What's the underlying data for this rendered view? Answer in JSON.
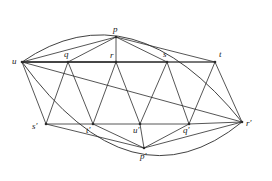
{
  "figure": {
    "type": "planar-graph-diagram",
    "width": 272,
    "height": 181,
    "background_color": "#ffffff",
    "stroke_color": "#2b2b2b",
    "label_color": "#1a1a1a",
    "stroke_width": 0.8,
    "boundary_stroke_width": 0.9
  },
  "vertices": [
    {
      "id": "u",
      "label": "u",
      "x": 22,
      "y": 62,
      "label_x": 12,
      "label_y": 57,
      "dot": true
    },
    {
      "id": "p",
      "label": "p",
      "x": 116,
      "y": 37,
      "label_x": 113,
      "label_y": 25,
      "dot": true
    },
    {
      "id": "q",
      "label": "q",
      "x": 68,
      "y": 62,
      "label_x": 64,
      "label_y": 50,
      "dot": true
    },
    {
      "id": "r",
      "label": "r",
      "x": 116,
      "y": 62,
      "label_x": 110,
      "label_y": 51,
      "dot": true
    },
    {
      "id": "s",
      "label": "s",
      "x": 167,
      "y": 62,
      "label_x": 163,
      "label_y": 50,
      "dot": true
    },
    {
      "id": "t",
      "label": "t",
      "x": 215,
      "y": 62,
      "label_x": 219,
      "label_y": 50,
      "dot": true
    },
    {
      "id": "sp",
      "label": "s′",
      "x": 46,
      "y": 124,
      "label_x": 32,
      "label_y": 122,
      "dot": true
    },
    {
      "id": "tp",
      "label": "t′",
      "x": 93,
      "y": 124,
      "label_x": 86,
      "label_y": 126,
      "dot": true
    },
    {
      "id": "up",
      "label": "u′",
      "x": 140,
      "y": 124,
      "label_x": 133,
      "label_y": 126,
      "dot": true
    },
    {
      "id": "qp",
      "label": "q′",
      "x": 189,
      "y": 124,
      "label_x": 183,
      "label_y": 126,
      "dot": true
    },
    {
      "id": "rp",
      "label": "r′",
      "x": 242,
      "y": 122,
      "label_x": 246,
      "label_y": 119,
      "dot": true
    },
    {
      "id": "pp",
      "label": "p′",
      "x": 144,
      "y": 148,
      "label_x": 140,
      "label_y": 152,
      "dot": true
    }
  ],
  "edges": [
    {
      "from": "u",
      "to": "p"
    },
    {
      "from": "u",
      "to": "q"
    },
    {
      "from": "u",
      "to": "r"
    },
    {
      "from": "u",
      "to": "s"
    },
    {
      "from": "u",
      "to": "t"
    },
    {
      "from": "p",
      "to": "q"
    },
    {
      "from": "p",
      "to": "r"
    },
    {
      "from": "p",
      "to": "s"
    },
    {
      "from": "p",
      "to": "t"
    },
    {
      "from": "q",
      "to": "r"
    },
    {
      "from": "r",
      "to": "s"
    },
    {
      "from": "s",
      "to": "t"
    },
    {
      "from": "u",
      "to": "sp"
    },
    {
      "from": "u",
      "to": "rp"
    },
    {
      "from": "q",
      "to": "sp"
    },
    {
      "from": "q",
      "to": "tp"
    },
    {
      "from": "r",
      "to": "tp"
    },
    {
      "from": "r",
      "to": "up"
    },
    {
      "from": "s",
      "to": "up"
    },
    {
      "from": "s",
      "to": "qp"
    },
    {
      "from": "t",
      "to": "qp"
    },
    {
      "from": "t",
      "to": "rp"
    },
    {
      "from": "sp",
      "to": "tp"
    },
    {
      "from": "tp",
      "to": "up"
    },
    {
      "from": "up",
      "to": "qp"
    },
    {
      "from": "qp",
      "to": "rp"
    },
    {
      "from": "sp",
      "to": "pp"
    },
    {
      "from": "tp",
      "to": "pp"
    },
    {
      "from": "up",
      "to": "pp"
    },
    {
      "from": "qp",
      "to": "pp"
    },
    {
      "from": "rp",
      "to": "pp"
    }
  ],
  "boundary_arcs": [
    {
      "id": "top-arc",
      "from": "u",
      "to": "rp",
      "control_x": 132,
      "control_y": -14
    },
    {
      "id": "bottom-arc",
      "from": "u",
      "to": "rp",
      "control_x": 132,
      "control_y": 212
    }
  ],
  "notes": {
    "description": "Triangulated lens-shaped planar graph with apex vertices p and p-prime"
  }
}
